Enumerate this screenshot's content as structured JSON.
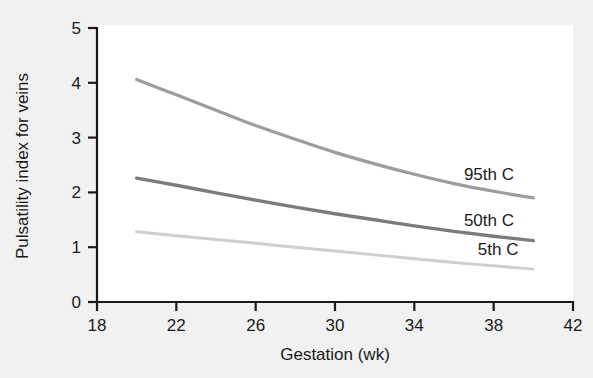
{
  "figure": {
    "background_color": "#f1f1f1",
    "plot_background_color": "#ffffff",
    "axis_color": "#1a1a1a"
  },
  "chart_data": {
    "type": "line",
    "title": "",
    "subtitle": "",
    "xlabel": "Gestation (wk)",
    "ylabel": "Pulsatility index for veins",
    "xlim": [
      18,
      42
    ],
    "ylim": [
      0,
      5
    ],
    "xticks": [
      18,
      22,
      26,
      30,
      34,
      38,
      42
    ],
    "yticks": [
      0,
      1,
      2,
      3,
      4,
      5
    ],
    "xtick_labels": [
      "18",
      "22",
      "26",
      "30",
      "34",
      "38",
      "42"
    ],
    "ytick_labels": [
      "0",
      "1",
      "2",
      "3",
      "4",
      "5"
    ],
    "grid": false,
    "legend_position": "inline-right-of-curves",
    "x": [
      20,
      22,
      24,
      26,
      28,
      30,
      32,
      34,
      36,
      38,
      40
    ],
    "series": [
      {
        "name": "95th C",
        "label": "95th C",
        "color": "#9d9d9d",
        "line_width": 3.2,
        "label_x": 36.5,
        "label_y": 2.22,
        "values": [
          4.06,
          3.78,
          3.5,
          3.22,
          2.97,
          2.73,
          2.52,
          2.33,
          2.16,
          2.02,
          1.9
        ]
      },
      {
        "name": "50th C",
        "label": "50th C",
        "color": "#7b7b7b",
        "line_width": 3.4,
        "label_x": 36.5,
        "label_y": 1.38,
        "values": [
          2.26,
          2.13,
          1.99,
          1.86,
          1.73,
          1.61,
          1.5,
          1.39,
          1.29,
          1.2,
          1.12
        ]
      },
      {
        "name": "5th C",
        "label": "5th C",
        "color": "#cfcfcf",
        "line_width": 3.0,
        "label_x": 37.2,
        "label_y": 0.86,
        "values": [
          1.28,
          1.21,
          1.14,
          1.07,
          1.0,
          0.93,
          0.86,
          0.79,
          0.72,
          0.66,
          0.6
        ]
      }
    ]
  }
}
